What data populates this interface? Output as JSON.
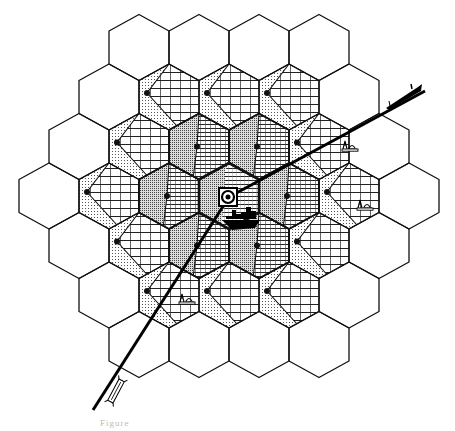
{
  "figure": {
    "type": "hexagonal cell grid diagram",
    "caption_fragment": "Figure",
    "grid": {
      "orientation": "pointy-top",
      "hex_width": 60,
      "hex_side": 33,
      "row_step": 49.5,
      "center": [
        229,
        196
      ],
      "rows": [
        4,
        5,
        6,
        7,
        6,
        5,
        4
      ],
      "patterned_rings": 2,
      "outer_ring": "blank"
    },
    "center_cell": {
      "symbol": "target-circle",
      "outline": "bold"
    },
    "icons": {
      "central_ship": "ship-icon",
      "tanker_top_right": "tanker-icon",
      "bottom_left_vessel": "barge-icon",
      "rigs": "drilling-rig-icon"
    },
    "lines": {
      "ne_route": {
        "from": [
          229,
          197
        ],
        "to": [
          425,
          91
        ]
      },
      "sw_route": {
        "from": [
          229,
          197
        ],
        "to": [
          93,
          410
        ]
      }
    },
    "colors": {
      "ink": "#111111",
      "background": "#ffffff"
    }
  }
}
